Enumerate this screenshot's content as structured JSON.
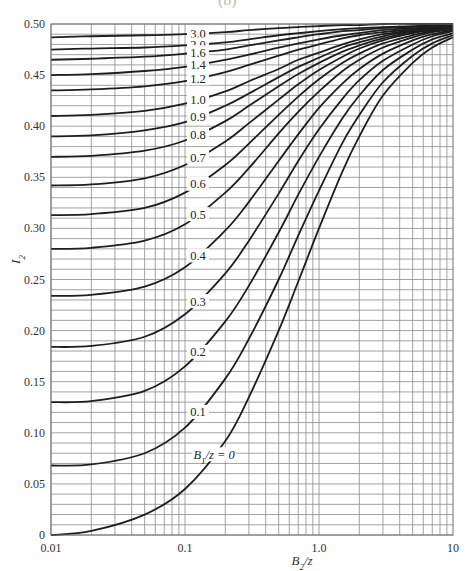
{
  "figure": {
    "partial_title": "(b)"
  },
  "chart_data": {
    "type": "line",
    "title": "",
    "xlabel": "B2/z",
    "ylabel": "I2",
    "xscale": "log",
    "xlim": [
      0.01,
      10
    ],
    "ylim": [
      0,
      0.5
    ],
    "grid": true,
    "x_ticks": [
      {
        "value": 0.01,
        "label": "0.01"
      },
      {
        "value": 0.1,
        "label": "0.1"
      },
      {
        "value": 1.0,
        "label": "1.0"
      },
      {
        "value": 10,
        "label": "10"
      }
    ],
    "y_ticks": [
      {
        "value": 0,
        "label": "0"
      },
      {
        "value": 0.05,
        "label": "0.05"
      },
      {
        "value": 0.1,
        "label": "0.10"
      },
      {
        "value": 0.15,
        "label": "0.15"
      },
      {
        "value": 0.2,
        "label": "0.20"
      },
      {
        "value": 0.25,
        "label": "0.25"
      },
      {
        "value": 0.3,
        "label": "0.30"
      },
      {
        "value": 0.35,
        "label": "0.35"
      },
      {
        "value": 0.4,
        "label": "0.40"
      },
      {
        "value": 0.45,
        "label": "0.45"
      },
      {
        "value": 0.5,
        "label": "0.50"
      }
    ],
    "x": [
      0.01,
      0.02,
      0.05,
      0.1,
      0.2,
      0.3,
      0.5,
      0.7,
      1.0,
      1.5,
      2.0,
      3.0,
      5.0,
      7.0,
      10.0
    ],
    "series": [
      {
        "name": "3.0",
        "label": "3.0",
        "label_x": 0.125,
        "values": [
          0.487,
          0.488,
          0.489,
          0.49,
          0.492,
          0.494,
          0.496,
          0.497,
          0.498,
          0.499,
          0.499,
          0.5,
          0.5,
          0.5,
          0.5
        ]
      },
      {
        "name": "2.0",
        "label": "2.0",
        "label_x": 0.125,
        "values": [
          0.475,
          0.476,
          0.477,
          0.479,
          0.482,
          0.485,
          0.489,
          0.491,
          0.493,
          0.495,
          0.496,
          0.497,
          0.498,
          0.499,
          0.5
        ]
      },
      {
        "name": "1.6",
        "label": "1.6",
        "label_x": 0.125,
        "values": [
          0.465,
          0.466,
          0.468,
          0.471,
          0.475,
          0.479,
          0.484,
          0.487,
          0.49,
          0.493,
          0.494,
          0.496,
          0.497,
          0.498,
          0.499
        ]
      },
      {
        "name": "1.4",
        "label": "1.4",
        "label_x": 0.125,
        "values": [
          0.45,
          0.451,
          0.454,
          0.458,
          0.465,
          0.47,
          0.477,
          0.481,
          0.485,
          0.489,
          0.491,
          0.494,
          0.496,
          0.497,
          0.499
        ]
      },
      {
        "name": "1.2",
        "label": "1.2",
        "label_x": 0.125,
        "values": [
          0.435,
          0.436,
          0.439,
          0.444,
          0.453,
          0.46,
          0.469,
          0.475,
          0.48,
          0.486,
          0.489,
          0.492,
          0.495,
          0.497,
          0.498
        ]
      },
      {
        "name": "1.0",
        "label": "1.0",
        "label_x": 0.125,
        "values": [
          0.41,
          0.411,
          0.415,
          0.422,
          0.434,
          0.444,
          0.456,
          0.465,
          0.472,
          0.48,
          0.485,
          0.49,
          0.494,
          0.496,
          0.498
        ]
      },
      {
        "name": "0.9",
        "label": "0.9",
        "label_x": 0.125,
        "values": [
          0.39,
          0.391,
          0.396,
          0.404,
          0.42,
          0.432,
          0.448,
          0.458,
          0.467,
          0.477,
          0.482,
          0.488,
          0.493,
          0.495,
          0.497
        ]
      },
      {
        "name": "0.8",
        "label": "0.8",
        "label_x": 0.125,
        "values": [
          0.37,
          0.371,
          0.376,
          0.386,
          0.405,
          0.42,
          0.439,
          0.451,
          0.462,
          0.473,
          0.479,
          0.486,
          0.492,
          0.495,
          0.497
        ]
      },
      {
        "name": "0.7",
        "label": "0.7",
        "label_x": 0.125,
        "values": [
          0.342,
          0.343,
          0.349,
          0.362,
          0.385,
          0.403,
          0.426,
          0.441,
          0.455,
          0.468,
          0.476,
          0.484,
          0.491,
          0.494,
          0.496
        ]
      },
      {
        "name": "0.6",
        "label": "0.6",
        "label_x": 0.125,
        "values": [
          0.313,
          0.314,
          0.32,
          0.335,
          0.362,
          0.383,
          0.411,
          0.429,
          0.446,
          0.462,
          0.471,
          0.481,
          0.489,
          0.493,
          0.496
        ]
      },
      {
        "name": "0.5",
        "label": "0.5",
        "label_x": 0.125,
        "values": [
          0.28,
          0.281,
          0.288,
          0.304,
          0.335,
          0.359,
          0.393,
          0.414,
          0.434,
          0.454,
          0.465,
          0.477,
          0.487,
          0.492,
          0.495
        ]
      },
      {
        "name": "0.4",
        "label": "0.4",
        "label_x": 0.125,
        "values": [
          0.234,
          0.235,
          0.243,
          0.262,
          0.298,
          0.326,
          0.366,
          0.392,
          0.418,
          0.442,
          0.456,
          0.471,
          0.484,
          0.49,
          0.494
        ]
      },
      {
        "name": "0.3",
        "label": "0.3",
        "label_x": 0.125,
        "values": [
          0.184,
          0.185,
          0.194,
          0.216,
          0.256,
          0.288,
          0.334,
          0.366,
          0.397,
          0.427,
          0.445,
          0.464,
          0.48,
          0.488,
          0.493
        ]
      },
      {
        "name": "0.2",
        "label": "0.2",
        "label_x": 0.125,
        "values": [
          0.13,
          0.131,
          0.141,
          0.165,
          0.209,
          0.244,
          0.296,
          0.333,
          0.37,
          0.408,
          0.43,
          0.455,
          0.475,
          0.485,
          0.491
        ]
      },
      {
        "name": "0.1",
        "label": "0.1",
        "label_x": 0.125,
        "values": [
          0.068,
          0.069,
          0.08,
          0.105,
          0.153,
          0.192,
          0.25,
          0.293,
          0.337,
          0.384,
          0.411,
          0.443,
          0.469,
          0.481,
          0.489
        ]
      },
      {
        "name": "0",
        "label": "B1/z = 0",
        "label_x": 0.165,
        "values": [
          0.0,
          0.004,
          0.02,
          0.045,
          0.092,
          0.135,
          0.2,
          0.248,
          0.3,
          0.356,
          0.39,
          0.43,
          0.462,
          0.477,
          0.487
        ]
      }
    ]
  }
}
